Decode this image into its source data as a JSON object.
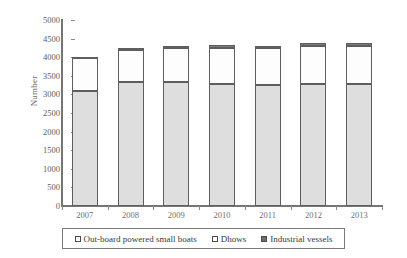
{
  "chart_data": {
    "type": "bar",
    "subtype": "stacked-bar",
    "title": "",
    "xlabel": "",
    "ylabel": "Number",
    "ylim": [
      0,
      5000
    ],
    "ytick_step": 500,
    "yticks": [
      0,
      500,
      1000,
      1500,
      2000,
      2500,
      3000,
      3500,
      4000,
      4500,
      5000
    ],
    "grid": false,
    "legend_position": "bottom",
    "categories": [
      "2007",
      "2008",
      "2009",
      "2010",
      "2011",
      "2012",
      "2013"
    ],
    "series": [
      {
        "name": "Out-board powered small boats",
        "color": "#dedede",
        "values": [
          3100,
          3320,
          3330,
          3290,
          3250,
          3270,
          3280
        ]
      },
      {
        "name": "Dhows",
        "color": "#fdfdfd",
        "values": [
          870,
          880,
          910,
          960,
          990,
          1020,
          1030
        ]
      },
      {
        "name": "Industrial vessels",
        "color": "#7c7c7c",
        "values": [
          40,
          60,
          70,
          70,
          70,
          80,
          80
        ]
      }
    ],
    "totals": [
      4010,
      4260,
      4310,
      4320,
      4310,
      4370,
      4390
    ]
  },
  "legend": {
    "items": [
      {
        "label": "Out-board powered small boats",
        "swatch": "legend-swatch-outboard"
      },
      {
        "label": "Dhows",
        "swatch": "legend-swatch-dhows"
      },
      {
        "label": "Industrial vessels",
        "swatch": "legend-swatch-industrial"
      }
    ]
  },
  "axes": {
    "y_title": "Number"
  }
}
